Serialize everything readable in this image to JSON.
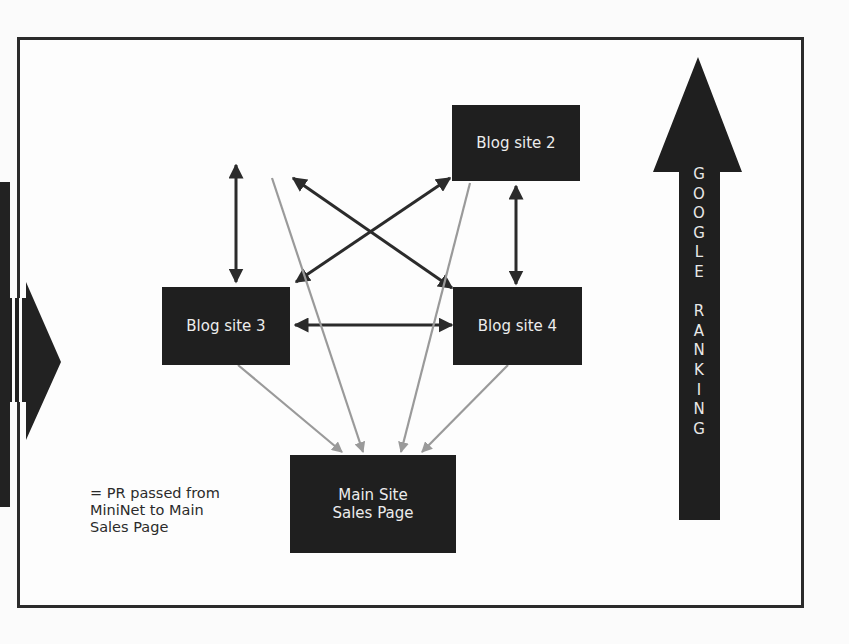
{
  "diagram": {
    "nodes": [
      {
        "id": "blog2",
        "label": "Blog site 2"
      },
      {
        "id": "blog3",
        "label": "Blog site 3"
      },
      {
        "id": "blog4",
        "label": "Blog site 4"
      },
      {
        "id": "main",
        "label_line1": "Main Site",
        "label_line2": "Sales Page"
      }
    ],
    "legend": {
      "line1": "= PR passed from",
      "line2": "MiniNet to Main",
      "line3": "Sales Page"
    },
    "ranking_arrow": {
      "letters": [
        "G",
        "O",
        "O",
        "G",
        "L",
        "E",
        " ",
        "R",
        "A",
        "N",
        "K",
        "I",
        "N",
        "G"
      ],
      "label": "GOOGLE RANKING"
    },
    "colors": {
      "node_fill": "#1f1f1f",
      "link_arrow": "#2b2b2b",
      "pr_arrow": "#9a9a9a",
      "frame": "#2b2b2b"
    }
  }
}
